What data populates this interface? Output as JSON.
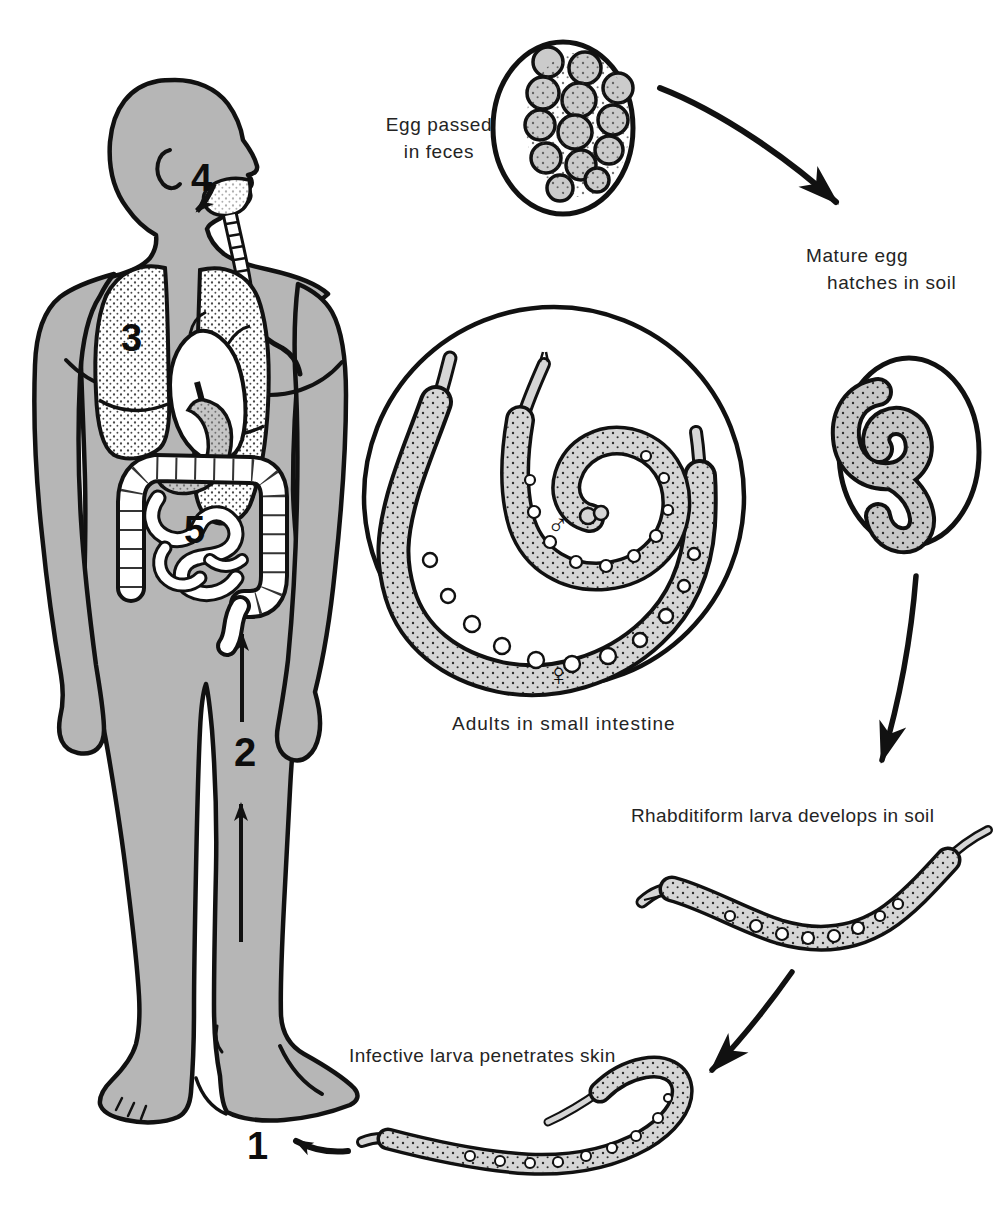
{
  "labels": {
    "egg_passed_line1": "Egg passed",
    "egg_passed_line2": "in feces",
    "mature_egg_line1": "Mature egg",
    "mature_egg_line2": "hatches in soil",
    "adults": "Adults in small intestine",
    "rhabditiform": "Rhabditiform larva develops in soil",
    "infective": "Infective larva penetrates skin"
  },
  "stage_numbers": {
    "skin_penetration": "1",
    "migration_up_body": "2",
    "lungs": "3",
    "pharynx_swallowed": "4",
    "small_intestine": "5"
  },
  "symbols": {
    "male": "♂",
    "female": "♀"
  },
  "colors": {
    "background": "#ffffff",
    "body_fill": "#b6b6b6",
    "outline": "#111111",
    "worm_fill": "#d0d0d0",
    "text": "#242424"
  }
}
